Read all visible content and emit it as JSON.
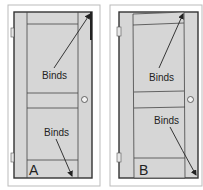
{
  "figure": {
    "panels": [
      {
        "id": "A",
        "label": "A",
        "annotations": [
          {
            "text": "Binds",
            "points_to": "top-right corner"
          },
          {
            "text": "Binds",
            "points_to": "bottom edge near latch side"
          }
        ]
      },
      {
        "id": "B",
        "label": "B",
        "annotations": [
          {
            "text": "Binds",
            "points_to": "top edge near latch side"
          },
          {
            "text": "Binds",
            "points_to": "bottom-right corner"
          }
        ]
      }
    ],
    "colors": {
      "door_fill": "#d6d6d6",
      "frame_stroke": "#333333",
      "outer_border": "#bbbbbb",
      "background": "#ffffff"
    }
  }
}
